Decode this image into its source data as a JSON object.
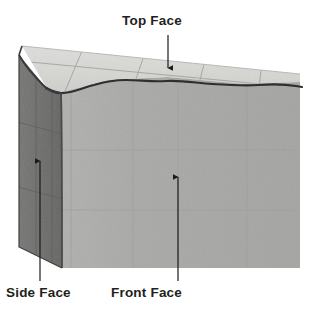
{
  "figure": {
    "title": "",
    "type": "labeled-3d-block-diagram",
    "background_color": "#ffffff"
  },
  "labels": {
    "top_face": "Top Face",
    "side_face": "Side Face",
    "front_face": "Front Face"
  },
  "colors": {
    "top_face_fill": "#d9d9d5",
    "front_face_fill": "#a9a9a7",
    "side_face_fill": "#6f6f6d",
    "outline": "#2b2b2b",
    "grid_line_top": "#9a9a96",
    "grid_line_front": "#9c9c9a",
    "grid_line_side": "#5a5a58",
    "label_text": "#231f20",
    "arrow": "#1a1a1a"
  },
  "annotations": [
    {
      "name": "top-face-annotation",
      "label": "Top Face",
      "arrow_direction": "down",
      "arrow_from": [
        168,
        35
      ],
      "arrow_to": [
        168,
        68
      ]
    },
    {
      "name": "side-face-annotation",
      "label": "Side Face",
      "arrow_direction": "up",
      "arrow_from": [
        40,
        281
      ],
      "arrow_to": [
        40,
        161
      ]
    },
    {
      "name": "front-face-annotation",
      "label": "Front Face",
      "arrow_direction": "up",
      "arrow_from": [
        178,
        281
      ],
      "arrow_to": [
        178,
        177
      ]
    }
  ]
}
